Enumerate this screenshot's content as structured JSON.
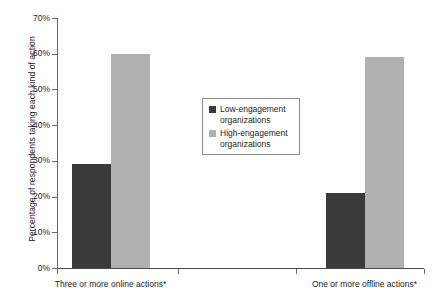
{
  "chart_data": {
    "type": "bar",
    "title": "",
    "xlabel": "",
    "ylabel": "Percentage of respondents taking each kind of action",
    "ylim": [
      0,
      70
    ],
    "ytick_labels": [
      "70%",
      "60%",
      "50%",
      "40%",
      "30%",
      "20%",
      "10%",
      "0%"
    ],
    "ytick_values": [
      70,
      60,
      50,
      40,
      30,
      20,
      10,
      0
    ],
    "grid": false,
    "legend_position": "center",
    "categories": [
      "Three or more online actions*",
      "One or more offline actions*"
    ],
    "series": [
      {
        "name": "Low-engagement organizations",
        "color": "#3a3a3a",
        "values": [
          29,
          21
        ]
      },
      {
        "name": "High-engagement organizations",
        "color": "#b0b0b0",
        "values": [
          60,
          59
        ]
      }
    ]
  },
  "legend": {
    "entries": [
      {
        "label_line1": "Low-engagement",
        "label_line2": "organizations"
      },
      {
        "label_line1": "High-engagement",
        "label_line2": "organizations"
      }
    ]
  }
}
